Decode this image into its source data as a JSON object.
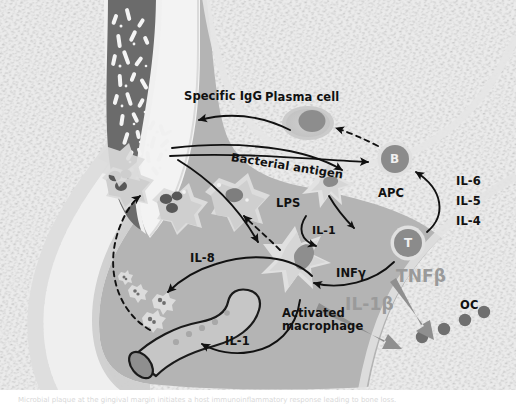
{
  "figure": {
    "domain_note": "grayscale biomedical diagram"
  },
  "labels": {
    "specific_igg": "Specific IgG",
    "plasma_cell": "Plasma cell",
    "bacterial_antigen": "Bacterial antigen",
    "lps": "LPS",
    "apc": "APC",
    "b_cell": "B",
    "t_cell": "T",
    "il_6": "IL-6",
    "il_5": "IL-5",
    "il_4": "IL-4",
    "il_1_apc": "IL-1",
    "il_8": "IL-8",
    "inf_gamma": "INFγ",
    "tnf_beta": "TNFβ",
    "il_1_beta": "IL-1β",
    "oc": "OC",
    "activated_macrophage_l1": "Activated",
    "activated_macrophage_l2": "macrophage",
    "il_1_vessel": "IL-1"
  },
  "colors": {
    "bone_stipple_bg": "#e9e9e9",
    "bone_stipple_dot": "#c3c3c3",
    "connective_tissue": "#b4b4b4",
    "gingival_margin": "#cfcfcf",
    "tooth_enamel": "#efefef",
    "tooth_dentin": "#e4e4e4",
    "pocket_plaque": "#6d6d6d",
    "bacteria_light": "#f2f2f2",
    "cell_cytoplasm": "#d2d2d2",
    "cell_halo": "#dcdcdc",
    "nucleus_dark": "#5c5c5c",
    "nucleus_mid": "#8f8f8f",
    "arrow_black": "#111111",
    "arrow_gray": "#8c8c8c",
    "text_black": "#111111",
    "text_gray": "#9a9a9a",
    "page_white": "#ffffff"
  },
  "cells": {
    "pmn_count": 4,
    "pmn_label": "polymorphonuclear neutrophil",
    "osteoclast_dots": 4,
    "plasma_cell_label": "plasma cell",
    "vessel_label": "blood vessel"
  },
  "caption": {
    "text": "Microbial plaque at the gingival margin initiates a host immunoinflammatory response leading to bone loss."
  }
}
